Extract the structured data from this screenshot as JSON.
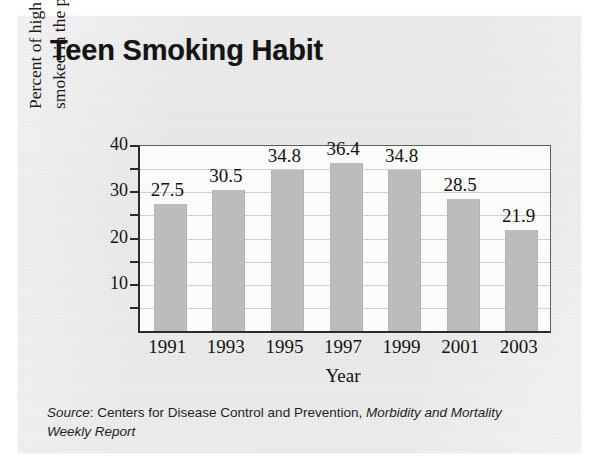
{
  "chart_data": {
    "type": "bar",
    "title": "Teen Smoking Habit",
    "categories": [
      "1991",
      "1993",
      "1995",
      "1997",
      "1999",
      "2001",
      "2003"
    ],
    "values": [
      27.5,
      30.5,
      34.8,
      36.4,
      34.8,
      28.5,
      21.9
    ],
    "value_labels": [
      "27.5",
      "30.5",
      "34.8",
      "36.4",
      "34.8",
      "28.5",
      "21.9"
    ],
    "xlabel": "Year",
    "ylabel_line1": "Percent of high school students who",
    "ylabel_line2": "smoked in the preceding 30 days",
    "ylim": [
      0,
      40
    ],
    "ytick_labels": [
      "40",
      "30",
      "20",
      "10"
    ],
    "ytick_values": [
      40,
      30,
      20,
      10
    ],
    "gridline_values": [
      5,
      10,
      15,
      20,
      25,
      30,
      35
    ],
    "minor_tick_values": [
      5,
      10,
      15,
      20,
      25,
      30,
      35,
      40
    ],
    "grid": true,
    "legend": "none",
    "bar_color": "#bcbcbc",
    "plot_background": "#fbfbfb",
    "axis_color": "#2b2b2b"
  },
  "source": {
    "label": "Source",
    "colon": ": ",
    "agency": "Centers for Disease Control and Prevention, ",
    "publication": "Morbidity and Mortality Weekly Report"
  }
}
